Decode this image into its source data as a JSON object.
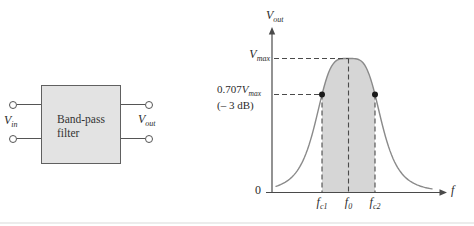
{
  "colors": {
    "background": "#ffffff",
    "box_fill": "#e3e3e3",
    "box_border": "#606060",
    "wire": "#555555",
    "curve": "#8a8a8a",
    "axis": "#4a4a4a",
    "dashed": "#4a4a4a",
    "shade": "#d6d6d6",
    "dot": "#1a1a1a",
    "text": "#2b2b2b"
  },
  "block_diagram": {
    "box_label_line1": "Band-pass",
    "box_label_line2": "filter",
    "input_label": {
      "base": "V",
      "sub": "in"
    },
    "output_label": {
      "base": "V",
      "sub": "out"
    }
  },
  "graph": {
    "y_axis_label": {
      "base": "V",
      "sub": "out"
    },
    "x_axis_label": "f",
    "origin_label": "0",
    "vmax_label": {
      "base": "V",
      "sub": "max"
    },
    "cutoff_label_line1": {
      "prefix": "0.707",
      "base": "V",
      "sub": "max"
    },
    "cutoff_label_line2": "(– 3 dB)",
    "x_tick_labels": [
      {
        "base": "f",
        "sub": "c1"
      },
      {
        "base": "f",
        "sub": "0"
      },
      {
        "base": "f",
        "sub": "c2"
      }
    ],
    "geometry": {
      "y_axis_x": 272,
      "x_axis_y": 192.5,
      "y_axis_top": 27,
      "x_axis_left": 266,
      "x_axis_right": 447,
      "peak_x": 348.5,
      "peak_y": 58.5,
      "fc1_x": 322,
      "fc2_x": 375,
      "cutoff_y": 94.5,
      "curve_width_param": 34,
      "curve_exponent": 4,
      "curve_x_start": 276,
      "curve_x_end": 433
    }
  }
}
